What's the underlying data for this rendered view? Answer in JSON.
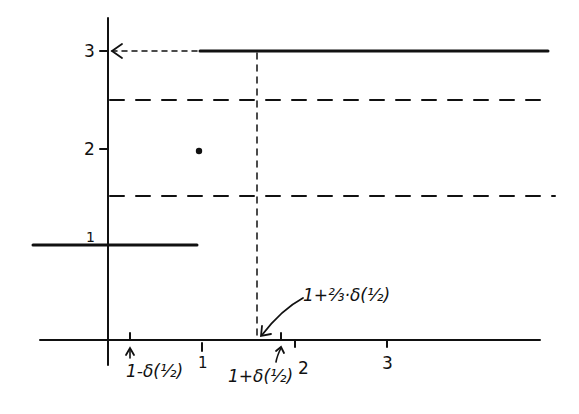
{
  "diagram": {
    "axes": {
      "y_ticks": [
        {
          "label": "3",
          "value": 3
        },
        {
          "label": "2",
          "value": 2
        },
        {
          "label": "1",
          "value": 1
        }
      ],
      "x_ticks": [
        {
          "label": "1",
          "value": 1
        },
        {
          "label": "2",
          "value": 2
        },
        {
          "label": "3",
          "value": 3
        }
      ]
    },
    "annotations": {
      "left_delta": "1-δ(½)",
      "right_delta": "1+δ(½)",
      "two_thirds_delta": "1+⅔·δ(½)"
    },
    "segments": [
      {
        "name": "lower-step",
        "y": 1,
        "x_range": "(-∞, 1)",
        "style": "solid"
      },
      {
        "name": "upper-step",
        "y": 3,
        "x_range": "(1, ∞)",
        "style": "solid"
      },
      {
        "name": "isolated-point",
        "x": 1,
        "y": 2,
        "style": "dot"
      },
      {
        "name": "band-upper",
        "y": 2.5,
        "style": "dashed"
      },
      {
        "name": "band-lower",
        "y": 1.5,
        "style": "dashed"
      }
    ],
    "colors": {
      "ink": "#111111",
      "background": "#ffffff"
    }
  }
}
